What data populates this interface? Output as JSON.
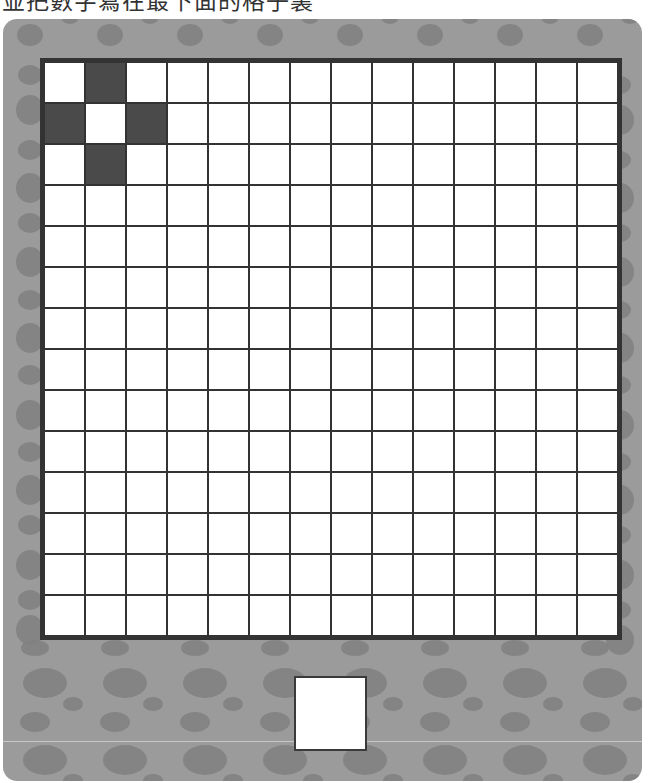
{
  "instruction": "並把數字寫在最下面的格子裏",
  "colors": {
    "panel": "#9b9b9b",
    "spot": "#808080",
    "grid_line": "#333333",
    "cell_empty": "#ffffff",
    "cell_shaded": "#4a4a4a"
  },
  "grid": {
    "rows": 14,
    "cols": 14,
    "shaded_cells": [
      [
        0,
        1
      ],
      [
        1,
        0
      ],
      [
        1,
        2
      ],
      [
        2,
        1
      ]
    ]
  },
  "answer_box": {
    "value": ""
  }
}
